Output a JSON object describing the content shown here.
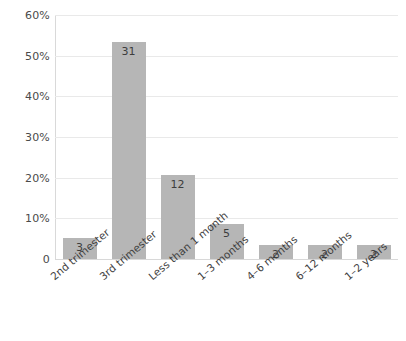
{
  "chart_data": {
    "type": "bar",
    "title": "",
    "subtitle": "",
    "xlabel": "",
    "ylabel": "",
    "categories": [
      "2nd trimester",
      "3rd trimester",
      "Less than 1 month",
      "1–3 months",
      "4–6 months",
      "6–12 months",
      "1–2 years"
    ],
    "values": [
      5.2,
      53.4,
      20.7,
      8.6,
      3.4,
      3.4,
      3.4
    ],
    "data_labels": [
      "3",
      "31",
      "12",
      "5",
      "2",
      "2",
      "2"
    ],
    "counts": [
      3,
      31,
      12,
      5,
      2,
      2,
      2
    ],
    "ylim": [
      0,
      60
    ],
    "ytick_values": [
      0,
      10,
      20,
      30,
      40,
      50,
      60
    ],
    "ytick_labels": [
      "0",
      "10%",
      "20%",
      "30%",
      "40%",
      "50%",
      "60%"
    ],
    "grid": "horizontal",
    "legend": "none",
    "bar_color": "#b6b6b6",
    "grid_color": "#e9e9e9",
    "axis_color": "#d9d9d9",
    "label_color": "#3d3d3d",
    "background": "#ffffff"
  }
}
